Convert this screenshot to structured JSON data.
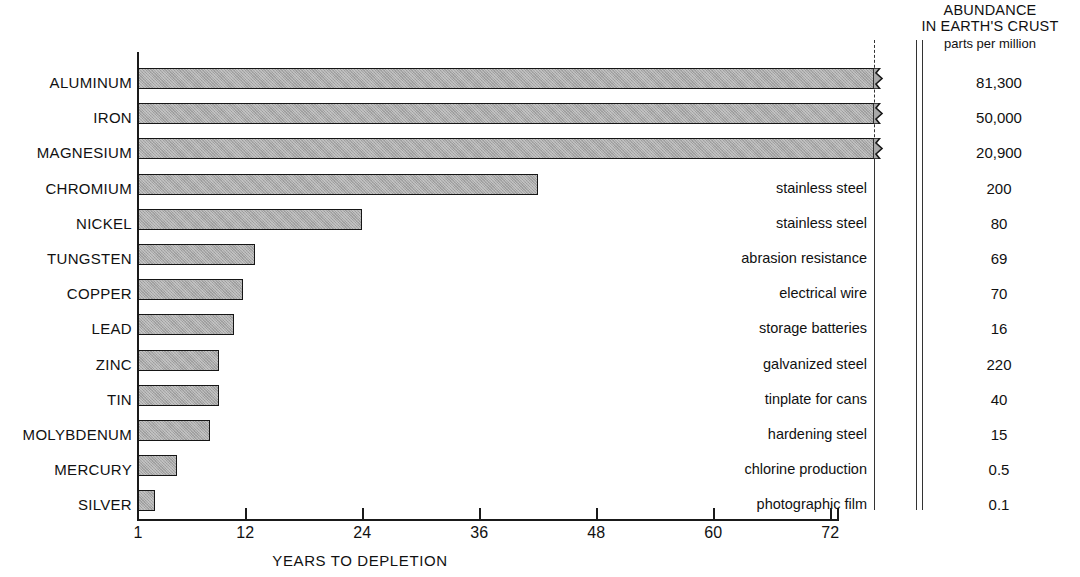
{
  "chart_data": {
    "type": "bar",
    "title": "",
    "xlabel": "YEARS TO DEPLETION",
    "ylabel": "",
    "orientation": "horizontal",
    "xlim": [
      1,
      76
    ],
    "xticks": [
      1,
      12,
      24,
      36,
      48,
      60,
      72
    ],
    "xticklabels": [
      "1",
      "12",
      "24",
      "36",
      "48",
      "60",
      "72"
    ],
    "grid": false,
    "legend": false,
    "note": "Top three bars (Aluminum, Iron, Magnesium) run off the scale and are drawn with a break mark at the right edge.",
    "categories": [
      "ALUMINUM",
      "IRON",
      "MAGNESIUM",
      "CHROMIUM",
      "NICKEL",
      "TUNGSTEN",
      "COPPER",
      "LEAD",
      "ZINC",
      "TIN",
      "MOLYBDENUM",
      "MERCURY",
      "SILVER"
    ],
    "values": [
      76,
      76,
      76,
      42,
      24,
      13,
      11.8,
      10.8,
      9.3,
      9.3,
      8.4,
      5,
      2.7
    ],
    "series": [
      {
        "name": "YEARS TO DEPLETION",
        "values": [
          76,
          76,
          76,
          42,
          24,
          13,
          11.8,
          10.8,
          9.3,
          9.3,
          8.4,
          5,
          2.7
        ]
      }
    ]
  },
  "header": {
    "line1": "ABUNDANCE",
    "line2": "IN EARTH'S CRUST",
    "line3": "parts per million"
  },
  "axis": {
    "x_title": "YEARS TO DEPLETION",
    "ticks": [
      {
        "label": "1",
        "value": 1
      },
      {
        "label": "12",
        "value": 12
      },
      {
        "label": "24",
        "value": 24
      },
      {
        "label": "36",
        "value": 36
      },
      {
        "label": "48",
        "value": 48
      },
      {
        "label": "60",
        "value": 60
      },
      {
        "label": "72",
        "value": 72
      }
    ]
  },
  "rows": [
    {
      "element": "ALUMINUM",
      "years": 76,
      "broken": true,
      "usage": "",
      "abundance": "81,300"
    },
    {
      "element": "IRON",
      "years": 76,
      "broken": true,
      "usage": "",
      "abundance": "50,000"
    },
    {
      "element": "MAGNESIUM",
      "years": 76,
      "broken": true,
      "usage": "",
      "abundance": "20,900"
    },
    {
      "element": "CHROMIUM",
      "years": 42,
      "broken": false,
      "usage": "stainless steel",
      "abundance": "200"
    },
    {
      "element": "NICKEL",
      "years": 24,
      "broken": false,
      "usage": "stainless steel",
      "abundance": "80"
    },
    {
      "element": "TUNGSTEN",
      "years": 13,
      "broken": false,
      "usage": "abrasion resistance",
      "abundance": "69"
    },
    {
      "element": "COPPER",
      "years": 11.8,
      "broken": false,
      "usage": "electrical wire",
      "abundance": "70"
    },
    {
      "element": "LEAD",
      "years": 10.8,
      "broken": false,
      "usage": "storage batteries",
      "abundance": "16"
    },
    {
      "element": "ZINC",
      "years": 9.3,
      "broken": false,
      "usage": "galvanized steel",
      "abundance": "220"
    },
    {
      "element": "TIN",
      "years": 9.3,
      "broken": false,
      "usage": "tinplate for cans",
      "abundance": "40"
    },
    {
      "element": "MOLYBDENUM",
      "years": 8.4,
      "broken": false,
      "usage": "hardening steel",
      "abundance": "15"
    },
    {
      "element": "MERCURY",
      "years": 5,
      "broken": false,
      "usage": "chlorine production",
      "abundance": "0.5"
    },
    {
      "element": "SILVER",
      "years": 2.7,
      "broken": false,
      "usage": "photographic film",
      "abundance": "0.1"
    }
  ],
  "colors": {
    "bar_fill": "#a9a9a9",
    "bar_stroke": "#161616",
    "axis": "#1a1a1a",
    "text": "#111111",
    "background": "#ffffff"
  }
}
